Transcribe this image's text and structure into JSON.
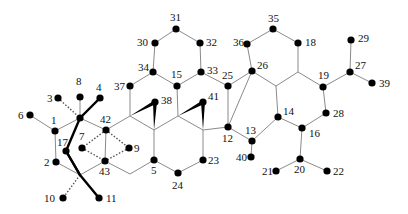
{
  "diagram": {
    "type": "labeled-molecular-graph",
    "atom_labels": {
      "1": "1",
      "2": "2",
      "3": "3",
      "4": "4",
      "5": "5",
      "6": "6",
      "7": "7",
      "8": "8",
      "9": "9",
      "10": "10",
      "11": "11",
      "12": "12",
      "13": "13",
      "14": "14",
      "15": "15",
      "16": "16",
      "17": "17",
      "18": "18",
      "19": "19",
      "20": "20",
      "21": "21",
      "22": "22",
      "23": "23",
      "24": "24",
      "25": "25",
      "26": "26",
      "27": "27",
      "28": "28",
      "29": "29",
      "30": "30",
      "31": "31",
      "32": "32",
      "33": "33",
      "34": "34",
      "35": "35",
      "36": "36",
      "37": "37",
      "38": "38",
      "39": "39",
      "40": "40",
      "41": "41",
      "42": "42",
      "43": "43"
    },
    "colors": {
      "atom": "#000000",
      "bond": "#8a8a8a",
      "label": "#111111"
    }
  }
}
